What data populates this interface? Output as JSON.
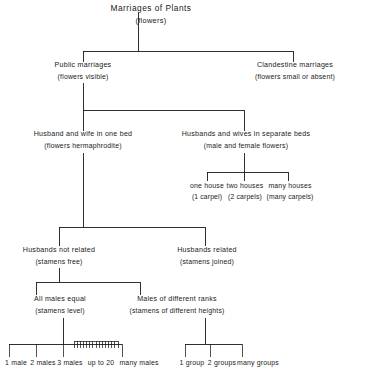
{
  "diagram": {
    "title": "Marriages of Plants",
    "type": "hierarchical-tree",
    "root": {
      "label": "Marriages of Plants",
      "sublabel": "(flowers)"
    },
    "level1": [
      {
        "label": "Public marriages",
        "sublabel": "(flowers visible)"
      },
      {
        "label": "Clandestine marriages",
        "sublabel": "(flowers small or absent)"
      }
    ],
    "level2": [
      {
        "label": "Husband and wife in one bed",
        "sublabel": "(flowers hermaphrodite)"
      },
      {
        "label": "Husbands and wives in separate beds",
        "sublabel": "(male and female flowers)"
      }
    ],
    "houses": [
      {
        "label": "one house",
        "sublabel": "(1 carpel)"
      },
      {
        "label": "two houses",
        "sublabel": "(2 carpels)"
      },
      {
        "label": "many houses",
        "sublabel": "(many carpels)"
      }
    ],
    "level3": [
      {
        "label": "Husbands not related",
        "sublabel": "(stamens free)"
      },
      {
        "label": "Husbands related",
        "sublabel": "(stamens joined)"
      }
    ],
    "level4": [
      {
        "label": "All males equal",
        "sublabel": "(stamens level)"
      },
      {
        "label": "Males of different ranks",
        "sublabel": "(stamens of different heights)"
      }
    ],
    "males_tips": [
      "1 male",
      "2 males",
      "3 males",
      "up to 20",
      "many males"
    ],
    "groups_tips": [
      "1 group",
      "2 groups",
      "many groups"
    ],
    "comb_tick_count": 15,
    "colors": {
      "ink": "#1a1a1a",
      "background": "#ffffff"
    }
  }
}
